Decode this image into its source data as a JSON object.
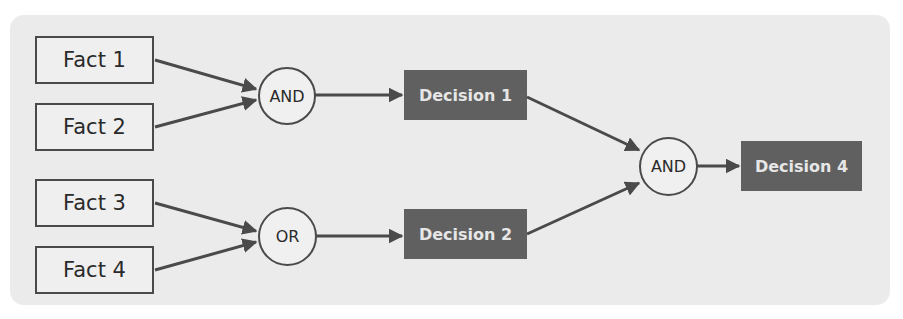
{
  "diagram": {
    "facts": [
      {
        "label": "Fact 1"
      },
      {
        "label": "Fact 2"
      },
      {
        "label": "Fact 3"
      },
      {
        "label": "Fact 4"
      }
    ],
    "gates": [
      {
        "label": "AND"
      },
      {
        "label": "OR"
      },
      {
        "label": "AND"
      }
    ],
    "decisions": [
      {
        "label": "Decision 1"
      },
      {
        "label": "Decision 2"
      },
      {
        "label": "Decision 4"
      }
    ],
    "edges": [
      {
        "from": "Fact 1",
        "to": "AND (1)"
      },
      {
        "from": "Fact 2",
        "to": "AND (1)"
      },
      {
        "from": "Fact 3",
        "to": "OR"
      },
      {
        "from": "Fact 4",
        "to": "OR"
      },
      {
        "from": "AND (1)",
        "to": "Decision 1"
      },
      {
        "from": "OR",
        "to": "Decision 2"
      },
      {
        "from": "Decision 1",
        "to": "AND (2)"
      },
      {
        "from": "Decision 2",
        "to": "AND (2)"
      },
      {
        "from": "AND (2)",
        "to": "Decision 4"
      }
    ],
    "colors": {
      "panel_bg": "#ebebeb",
      "line": "#4a4a4a",
      "decision_fill": "#606060",
      "decision_text": "#e6e6e6"
    }
  }
}
